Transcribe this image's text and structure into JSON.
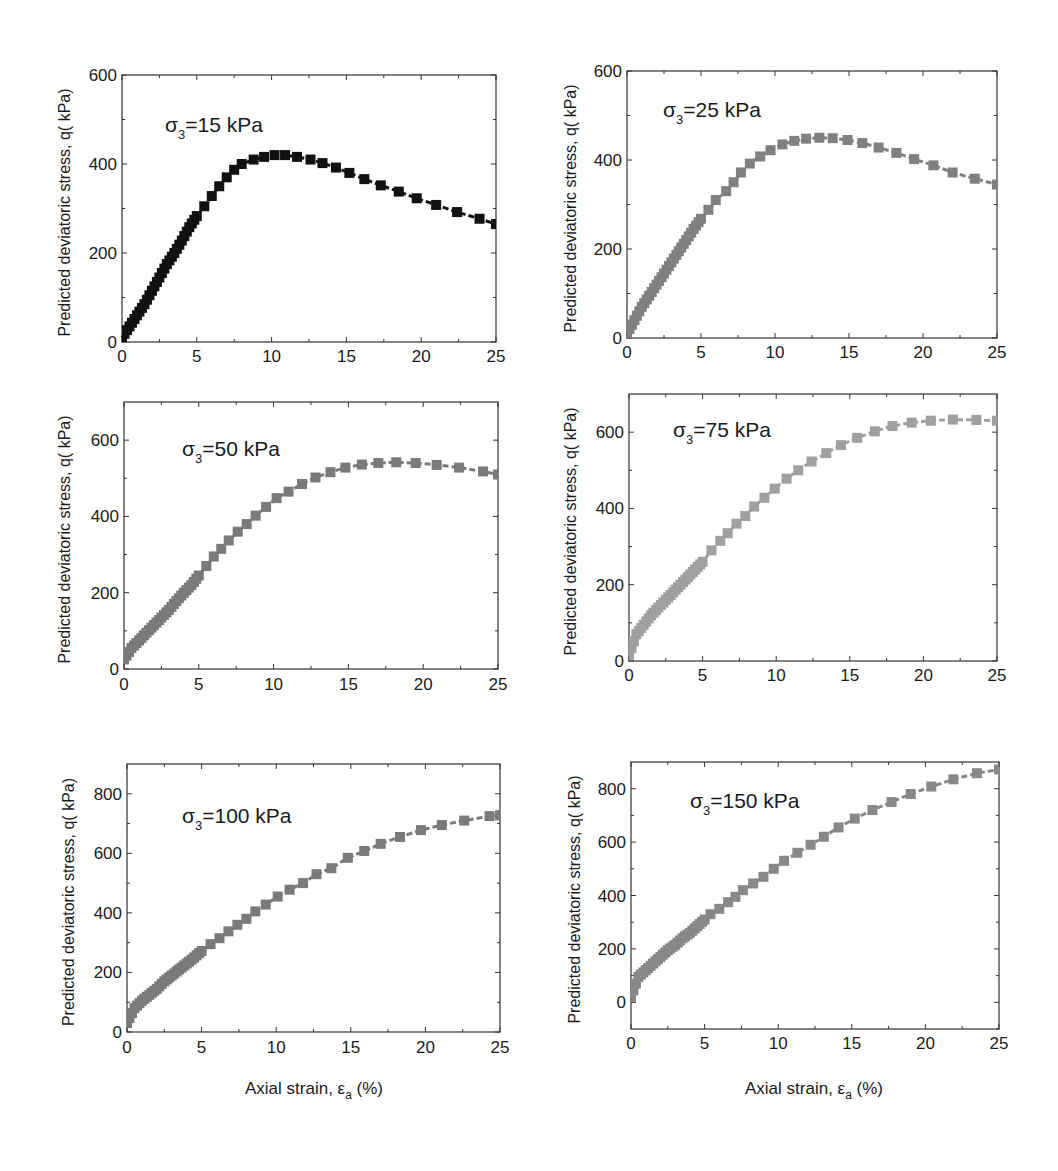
{
  "figure": {
    "ylabel": "Predicted deviatoric stress, q( kPa)",
    "xlabel_main": "Axial strain, ε",
    "xlabel_sub": "a",
    "xlabel_tail": " (%)"
  },
  "chart_data": [
    {
      "type": "scatter",
      "title": "σ3=15 kPa",
      "annotation": {
        "sigma": "σ",
        "sub": "3",
        "rest": "=15 kPa"
      },
      "xlabel": "",
      "ylabel": "Predicted deviatoric stress, q( kPa)",
      "xlim": [
        0,
        25
      ],
      "ylim": [
        0,
        600
      ],
      "xticks": [
        0,
        5,
        10,
        15,
        20,
        25
      ],
      "yticks": [
        0,
        200,
        400,
        600
      ],
      "marker_color": "#111111",
      "line_style": "dashed",
      "grid": false,
      "x": [
        0,
        0.5,
        1,
        1.5,
        2,
        2.5,
        3,
        3.5,
        4,
        4.5,
        5,
        5.5,
        6,
        6.5,
        7,
        7.5,
        8,
        8.8,
        9.5,
        10.2,
        10.9,
        11.7,
        12.6,
        13.4,
        14.3,
        15.2,
        16.2,
        17.3,
        18.5,
        19.7,
        21,
        22.4,
        23.9,
        25
      ],
      "values": [
        10,
        35,
        60,
        85,
        115,
        145,
        175,
        200,
        228,
        258,
        283,
        305,
        328,
        350,
        370,
        387,
        400,
        410,
        416,
        420,
        420,
        416,
        410,
        402,
        392,
        380,
        366,
        352,
        338,
        323,
        308,
        292,
        277,
        265
      ]
    },
    {
      "type": "scatter",
      "title": "σ3=25 kPa",
      "annotation": {
        "sigma": "σ",
        "sub": "3",
        "rest": "=25 kPa"
      },
      "xlabel": "",
      "ylabel": "Predicted deviatoric stress, q( kPa)",
      "xlim": [
        0,
        25
      ],
      "ylim": [
        0,
        600
      ],
      "xticks": [
        0,
        5,
        10,
        15,
        20,
        25
      ],
      "yticks": [
        0,
        200,
        400,
        600
      ],
      "marker_color": "#808080",
      "line_style": "dashed",
      "grid": false,
      "x": [
        0,
        0.5,
        1,
        1.5,
        2,
        2.5,
        3,
        3.5,
        4,
        4.5,
        5,
        5.5,
        6,
        6.7,
        7.2,
        7.7,
        8.3,
        9,
        9.7,
        10.5,
        11.3,
        12.1,
        13,
        13.9,
        14.9,
        15.9,
        17,
        18.2,
        19.4,
        20.7,
        22,
        23.5,
        25
      ],
      "values": [
        10,
        40,
        70,
        95,
        120,
        145,
        170,
        195,
        220,
        245,
        268,
        288,
        310,
        330,
        350,
        372,
        392,
        408,
        422,
        435,
        443,
        448,
        450,
        449,
        445,
        438,
        428,
        416,
        402,
        388,
        372,
        358,
        345
      ]
    },
    {
      "type": "scatter",
      "title": "σ3=50 kPa",
      "annotation": {
        "sigma": "σ",
        "sub": "3",
        "rest": "=50 kPa"
      },
      "xlabel": "",
      "ylabel": "Predicted deviatoric stress, q( kPa)",
      "xlim": [
        0,
        25
      ],
      "ylim": [
        0,
        700
      ],
      "xticks": [
        0,
        5,
        10,
        15,
        20,
        25
      ],
      "yticks": [
        0,
        200,
        400,
        600
      ],
      "marker_color": "#7a7a7a",
      "line_style": "dashed",
      "grid": false,
      "x": [
        0,
        0.5,
        1,
        1.5,
        2,
        2.5,
        3,
        3.5,
        4,
        4.5,
        5,
        5.5,
        6,
        6.5,
        7,
        7.6,
        8.2,
        8.8,
        9.5,
        10.2,
        11,
        11.9,
        12.8,
        13.8,
        14.8,
        15.9,
        17,
        18.2,
        19.5,
        20.9,
        22.4,
        24,
        25
      ],
      "values": [
        25,
        55,
        75,
        95,
        115,
        135,
        155,
        178,
        200,
        220,
        245,
        270,
        295,
        315,
        337,
        360,
        380,
        402,
        425,
        448,
        465,
        485,
        502,
        516,
        528,
        536,
        540,
        542,
        540,
        535,
        528,
        518,
        510
      ]
    },
    {
      "type": "scatter",
      "title": "σ3=75 kPa",
      "annotation": {
        "sigma": "σ",
        "sub": "3",
        "rest": "=75 kPa"
      },
      "xlabel": "",
      "ylabel": "Predicted deviatoric stress, q( kPa)",
      "xlim": [
        0,
        25
      ],
      "ylim": [
        0,
        700
      ],
      "xticks": [
        0,
        5,
        10,
        15,
        20,
        25
      ],
      "yticks": [
        0,
        200,
        400,
        600
      ],
      "marker_color": "#a0a0a0",
      "line_style": "dashed",
      "grid": false,
      "x": [
        0,
        0.5,
        1,
        1.5,
        2,
        2.5,
        3,
        3.5,
        4,
        4.5,
        5,
        5.6,
        6.2,
        6.7,
        7.3,
        7.9,
        8.5,
        9.2,
        9.9,
        10.7,
        11.5,
        12.4,
        13.4,
        14.4,
        15.5,
        16.7,
        17.9,
        19.2,
        20.5,
        22,
        23.6,
        25
      ],
      "values": [
        15,
        70,
        95,
        120,
        140,
        160,
        180,
        200,
        220,
        240,
        260,
        290,
        315,
        335,
        360,
        380,
        405,
        428,
        452,
        478,
        500,
        523,
        545,
        566,
        585,
        602,
        616,
        625,
        630,
        633,
        632,
        630
      ]
    },
    {
      "type": "scatter",
      "title": "σ3=100 kPa",
      "annotation": {
        "sigma": "σ",
        "sub": "3",
        "rest": "=100 kPa"
      },
      "xlabel": "Axial strain, εa (%)",
      "ylabel": "Predicted deviatoric stress, q( kPa)",
      "xlim": [
        0,
        25
      ],
      "ylim": [
        0,
        900
      ],
      "xticks": [
        0,
        5,
        10,
        15,
        20,
        25
      ],
      "yticks": [
        0,
        200,
        400,
        600,
        800
      ],
      "marker_color": "#7a7a7a",
      "line_style": "dashed",
      "grid": false,
      "x": [
        0,
        0.5,
        1,
        1.5,
        2,
        2.5,
        3,
        3.5,
        4,
        4.5,
        5,
        5.6,
        6.2,
        6.8,
        7.4,
        8,
        8.6,
        9.3,
        10.1,
        10.9,
        11.8,
        12.7,
        13.7,
        14.8,
        15.9,
        17,
        18.3,
        19.7,
        21.1,
        22.6,
        24.3,
        25
      ],
      "values": [
        30,
        80,
        105,
        125,
        145,
        170,
        190,
        210,
        230,
        250,
        272,
        295,
        315,
        338,
        360,
        380,
        405,
        428,
        455,
        478,
        500,
        530,
        550,
        585,
        608,
        632,
        655,
        678,
        695,
        710,
        725,
        728
      ]
    },
    {
      "type": "scatter",
      "title": "σ3=150 kPa",
      "annotation": {
        "sigma": "σ",
        "sub": "3",
        "rest": "=150 kPa"
      },
      "xlabel": "Axial strain, εa (%)",
      "ylabel": "Predicted deviatoric stress, q( kPa)",
      "xlim": [
        0,
        25
      ],
      "ylim": [
        -100,
        900
      ],
      "xticks": [
        0,
        5,
        10,
        15,
        20,
        25
      ],
      "yticks": [
        0,
        200,
        400,
        600,
        800
      ],
      "marker_color": "#888888",
      "line_style": "dashed",
      "grid": false,
      "x": [
        0,
        0.5,
        1,
        1.5,
        2,
        2.5,
        3,
        3.5,
        4,
        4.5,
        5,
        5.4,
        6,
        6.6,
        7.1,
        7.6,
        8.3,
        9,
        9.7,
        10.4,
        11.3,
        12.2,
        13.1,
        14.1,
        15.2,
        16.4,
        17.7,
        19,
        20.4,
        21.9,
        23.5,
        25
      ],
      "values": [
        20,
        95,
        120,
        145,
        170,
        195,
        215,
        240,
        260,
        285,
        310,
        330,
        350,
        375,
        395,
        420,
        445,
        470,
        500,
        530,
        560,
        590,
        620,
        655,
        688,
        720,
        750,
        780,
        808,
        835,
        858,
        872
      ]
    }
  ]
}
